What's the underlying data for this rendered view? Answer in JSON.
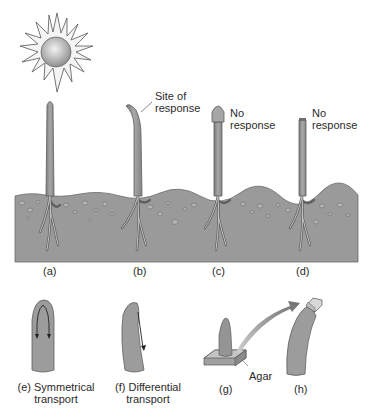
{
  "diagram": {
    "topic": "Phototropism in coleoptiles (auxin)",
    "labels": {
      "site_of_response": [
        "Site of",
        "response"
      ],
      "no_response_c": [
        "No",
        "response"
      ],
      "no_response_d": [
        "No",
        "response"
      ],
      "panel_a": "(a)",
      "panel_b": "(b)",
      "panel_c": "(c)",
      "panel_d": "(d)",
      "panel_e": [
        "(e) Symmetrical",
        "transport"
      ],
      "panel_f": [
        "(f) Differential",
        "transport"
      ],
      "panel_g": "(g)",
      "panel_h": "(h)",
      "agar": "Agar"
    },
    "colors": {
      "soil": "#9a9a9a",
      "soil_dark": "#7e7e7e",
      "stem": "#9c9c9c",
      "stem_edge": "#5e5e5e",
      "sun_core": "#bdbdbd",
      "arrow": "#7a7a7a",
      "background": "#ffffff"
    }
  }
}
